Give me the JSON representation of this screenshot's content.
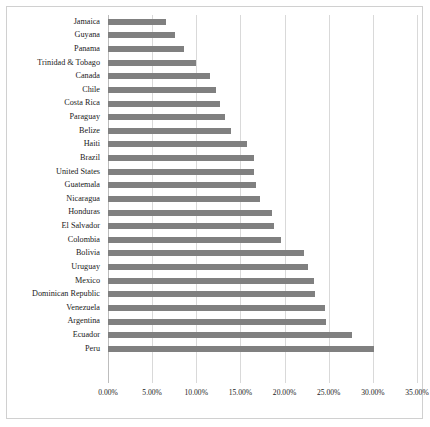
{
  "chart": {
    "type": "bar",
    "orientation": "horizontal",
    "bar_color": "#808080",
    "grid_color": "#d9d9d9",
    "background": "#ffffff",
    "border_color": "#d0d0d0"
  },
  "chart_data": {
    "type": "bar",
    "title": "",
    "subtitle": "",
    "xlabel": "",
    "ylabel": "",
    "orientation": "horizontal",
    "grid": true,
    "legend": false,
    "xlim": [
      0,
      35
    ],
    "xunit": "%",
    "xticks": [
      0,
      5,
      10,
      15,
      20,
      25,
      30,
      35
    ],
    "xtick_labels": [
      "0.00%",
      "5.00%",
      "10.00%",
      "15.00%",
      "20.00%",
      "25.00%",
      "30.00%",
      "35.00%"
    ],
    "categories": [
      "Jamaica",
      "Guyana",
      "Panama",
      "Trinidad & Tobago",
      "Canada",
      "Chile",
      "Costa Rica",
      "Paraguay",
      "Belize",
      "Haiti",
      "Brazil",
      "United States",
      "Guatemala",
      "Nicaragua",
      "Honduras",
      "El Salvador",
      "Colombia",
      "Bolivia",
      "Uruguay",
      "Mexico",
      "Dominican Republic",
      "Venezuela",
      "Argentina",
      "Ecuador",
      "Peru"
    ],
    "values": [
      6.6,
      7.6,
      8.6,
      10.0,
      11.6,
      12.2,
      12.7,
      13.2,
      13.9,
      15.8,
      16.5,
      16.5,
      16.8,
      17.2,
      18.6,
      18.8,
      19.6,
      22.2,
      22.7,
      23.3,
      23.5,
      24.6,
      24.7,
      27.6,
      30.1
    ]
  }
}
